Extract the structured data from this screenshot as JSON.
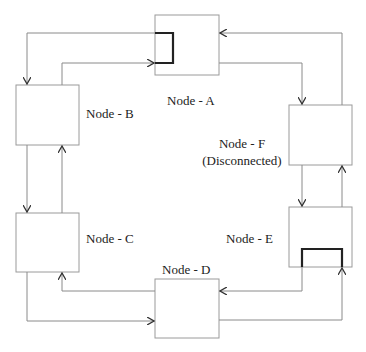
{
  "diagram": {
    "nodes": [
      {
        "id": "A",
        "label": "Node - A",
        "sub": ""
      },
      {
        "id": "B",
        "label": "Node - B",
        "sub": ""
      },
      {
        "id": "C",
        "label": "Node - C",
        "sub": ""
      },
      {
        "id": "D",
        "label": "Node - D",
        "sub": ""
      },
      {
        "id": "E",
        "label": "Node - E",
        "sub": ""
      },
      {
        "id": "F",
        "label": "Node - F",
        "sub": "(Disconnected)"
      }
    ],
    "colors": {
      "line": "#8a8a8a",
      "box": "#9a9a9a",
      "loopback": "#222222"
    }
  }
}
